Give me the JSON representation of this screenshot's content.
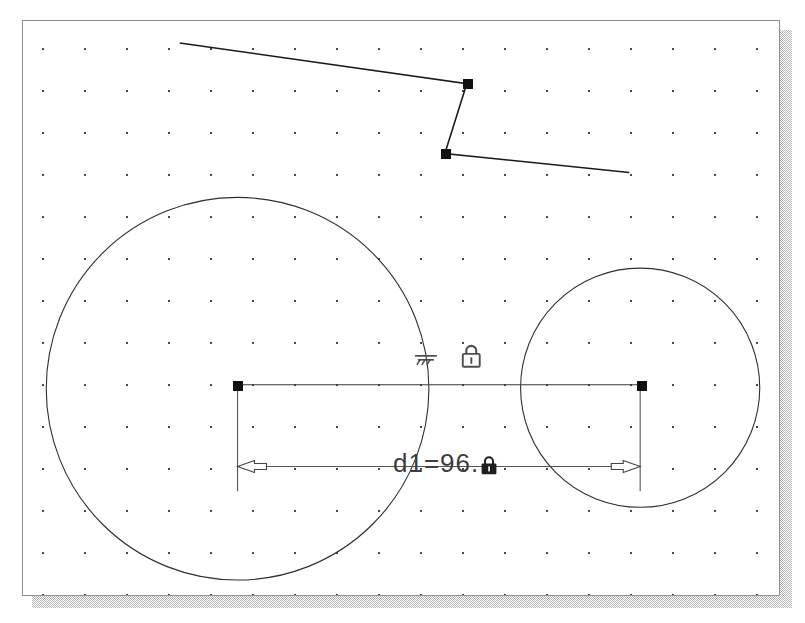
{
  "window": {
    "name": "sketch-canvas",
    "background_color": "#ffffff",
    "border_color": "#909090",
    "shadow_color": "#b4b4b4"
  },
  "grid": {
    "visible": true,
    "spacing_px": 42,
    "dot_color": "#3a3a3a"
  },
  "dimension": {
    "label_prefix": "d1",
    "equals": "=",
    "value": "96",
    "trailing": ".",
    "full_label": "d1=96.",
    "locked": true,
    "lock_icon": "padlock-filled-icon",
    "arrow_style": "outward"
  },
  "constraints": [
    {
      "name": "perpendicular-ground-constraint",
      "icon": "perpendicular-ground-icon",
      "x": 401,
      "y": 335
    },
    {
      "name": "lock-constraint",
      "icon": "padlock-icon",
      "x": 449,
      "y": 334
    }
  ],
  "geometry": {
    "circles": [
      {
        "name": "circle-large",
        "cx": 215,
        "cy": 369,
        "r": 192,
        "stroke": "#2e2e2e"
      },
      {
        "name": "circle-small",
        "cx": 619,
        "cy": 368,
        "r": 120,
        "stroke": "#2e2e2e"
      }
    ],
    "polyline": {
      "name": "open-polyline",
      "points": "157,22 445,63 423,133 608,152",
      "stroke": "#1a1a1a"
    },
    "vertices": [
      {
        "name": "polyline-vertex-1",
        "x": 445,
        "y": 63
      },
      {
        "name": "polyline-vertex-2",
        "x": 423,
        "y": 133
      },
      {
        "name": "center-handle-left",
        "x": 215,
        "y": 365
      },
      {
        "name": "center-handle-right",
        "x": 619,
        "y": 365
      }
    ],
    "center_line": {
      "name": "center-to-center-line",
      "x1": 215,
      "y1": 365,
      "x2": 619,
      "y2": 365
    },
    "dimension_line": {
      "name": "linear-dimension",
      "x1": 215,
      "x2": 619,
      "y": 447,
      "ext_top": 365,
      "ext_bottom": 470
    }
  },
  "colors": {
    "geometry_stroke": "#2e2e2e",
    "handle_fill": "#101010",
    "dimension_stroke": "#555555",
    "text": "#3c3c3c"
  }
}
